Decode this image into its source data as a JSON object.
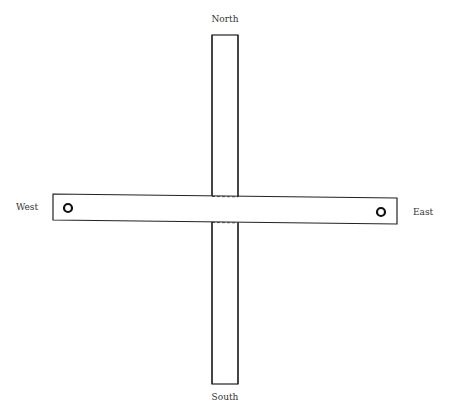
{
  "diagram": {
    "labels": {
      "north": "North",
      "south": "South",
      "west": "West",
      "east": "East"
    },
    "markers": [
      {
        "name": "west-hole",
        "position": "west"
      },
      {
        "name": "east-hole",
        "position": "east"
      }
    ],
    "stroke_color": "#222222",
    "fill_color": "#ffffff"
  }
}
